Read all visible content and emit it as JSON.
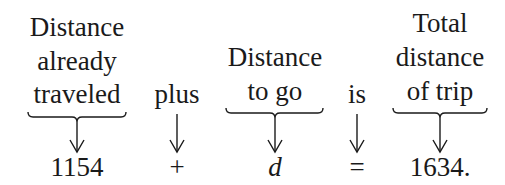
{
  "columns": [
    {
      "id": "already",
      "center_x": 77,
      "label_lines": [
        "Distance",
        "already",
        "traveled"
      ],
      "value": "1154",
      "brace": true,
      "brace_x1": 28,
      "brace_x2": 126
    },
    {
      "id": "plus",
      "center_x": 177,
      "label_lines": [
        "plus"
      ],
      "value": "+",
      "brace": false
    },
    {
      "id": "togo",
      "center_x": 275,
      "label_lines": [
        "Distance",
        "to go"
      ],
      "value": "d",
      "brace": true,
      "brace_x1": 226,
      "brace_x2": 323,
      "italic": true
    },
    {
      "id": "is",
      "center_x": 357,
      "label_lines": [
        "is"
      ],
      "value": "=",
      "brace": false
    },
    {
      "id": "total",
      "center_x": 440,
      "label_lines": [
        "Total",
        "distance",
        "of trip"
      ],
      "value": "1634.",
      "brace": true,
      "brace_x1": 393,
      "brace_x2": 487
    }
  ]
}
